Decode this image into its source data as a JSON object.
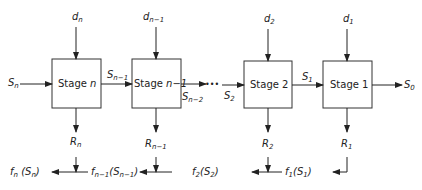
{
  "diagram": {
    "stages": [
      {
        "label": "Stage n",
        "decision": "d",
        "decision_sub": "n",
        "return": "R",
        "return_sub": "n"
      },
      {
        "label": "Stage n-1",
        "decision": "d",
        "decision_sub": "n-1",
        "return": "R",
        "return_sub": "n-1"
      },
      {
        "label": "Stage 2",
        "decision": "d",
        "decision_sub": "2",
        "return": "R",
        "return_sub": "2"
      },
      {
        "label": "Stage 1",
        "decision": "d",
        "decision_sub": "1",
        "return": "R",
        "return_sub": "1"
      }
    ],
    "stage_words": [
      "Stage",
      "Stage",
      "Stage",
      "Stage"
    ],
    "stage_ids": [
      "n",
      "n−1",
      "2",
      "1"
    ],
    "states": {
      "s_n": {
        "base": "S",
        "sub": "n"
      },
      "s_n1": {
        "base": "S",
        "sub": "n−1"
      },
      "s_n2": {
        "base": "S",
        "sub": "n−2"
      },
      "s_2": {
        "base": "S",
        "sub": "2"
      },
      "s_1": {
        "base": "S",
        "sub": "1"
      },
      "s_0": {
        "base": "S",
        "sub": "0"
      }
    },
    "ellipsis": "•••",
    "decisions": [
      {
        "base": "d",
        "sub": "n"
      },
      {
        "base": "d",
        "sub": "n−1"
      },
      {
        "base": "d",
        "sub": "2"
      },
      {
        "base": "d",
        "sub": "1"
      }
    ],
    "returns": [
      {
        "base": "R",
        "sub": "n"
      },
      {
        "base": "R",
        "sub": "n−1"
      },
      {
        "base": "R",
        "sub": "2"
      },
      {
        "base": "R",
        "sub": "1"
      }
    ],
    "objectives": [
      {
        "f": "f",
        "f_sub": "n",
        "open": "(",
        "s": "S",
        "s_sub": "n",
        "close": ")"
      },
      {
        "f": "f",
        "f_sub": "n−1",
        "open": "(",
        "s": "S",
        "s_sub": "n−1",
        "close": ")"
      },
      {
        "f": "f",
        "f_sub": "2",
        "open": "(",
        "s": "S",
        "s_sub": "2",
        "close": ")"
      },
      {
        "f": "f",
        "f_sub": "1",
        "open": "(",
        "s": "S",
        "s_sub": "1",
        "close": ")"
      }
    ]
  }
}
